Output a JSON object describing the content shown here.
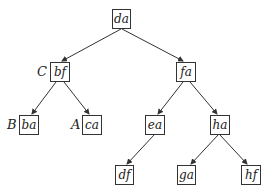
{
  "diagram": {
    "type": "binary-tree",
    "nodes": [
      {
        "id": "da",
        "label": "da",
        "tag": "",
        "x": 112,
        "y": 9,
        "w": 19,
        "h": 20
      },
      {
        "id": "bf",
        "label": "bf",
        "tag": "C",
        "x": 50,
        "y": 62,
        "w": 20,
        "h": 20
      },
      {
        "id": "fa",
        "label": "fa",
        "tag": "",
        "x": 176,
        "y": 62,
        "w": 20,
        "h": 20
      },
      {
        "id": "ba",
        "label": "ba",
        "tag": "B",
        "x": 19,
        "y": 115,
        "w": 20,
        "h": 20
      },
      {
        "id": "ca",
        "label": "ca",
        "tag": "A",
        "x": 82,
        "y": 115,
        "w": 20,
        "h": 20
      },
      {
        "id": "ea",
        "label": "ea",
        "tag": "",
        "x": 145,
        "y": 115,
        "w": 20,
        "h": 20
      },
      {
        "id": "ha",
        "label": "ha",
        "tag": "",
        "x": 210,
        "y": 115,
        "w": 20,
        "h": 20
      },
      {
        "id": "df",
        "label": "df",
        "tag": "",
        "x": 115,
        "y": 165,
        "w": 19,
        "h": 20
      },
      {
        "id": "ga",
        "label": "ga",
        "tag": "",
        "x": 177,
        "y": 165,
        "w": 19,
        "h": 20
      },
      {
        "id": "hf",
        "label": "hf",
        "tag": "",
        "x": 241,
        "y": 165,
        "w": 20,
        "h": 20
      }
    ],
    "edges": [
      {
        "from": "da",
        "to": "bf"
      },
      {
        "from": "da",
        "to": "fa"
      },
      {
        "from": "bf",
        "to": "ba"
      },
      {
        "from": "bf",
        "to": "ca"
      },
      {
        "from": "fa",
        "to": "ea"
      },
      {
        "from": "fa",
        "to": "ha"
      },
      {
        "from": "ea",
        "to": "df"
      },
      {
        "from": "ha",
        "to": "ga"
      },
      {
        "from": "ha",
        "to": "hf"
      }
    ],
    "tags": {
      "C": "C",
      "B": "B",
      "A": "A"
    }
  },
  "labels": {
    "da": "da",
    "bf": "bf",
    "fa": "fa",
    "ba": "ba",
    "ca": "ca",
    "ea": "ea",
    "ha": "ha",
    "df": "df",
    "ga": "ga",
    "hf": "hf",
    "tagC": "C",
    "tagB": "B",
    "tagA": "A"
  }
}
